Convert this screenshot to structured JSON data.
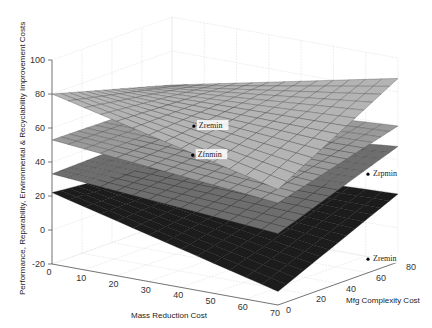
{
  "chart_data": {
    "type": "surface3d",
    "title": "",
    "xlabel": "Mass Reduction Cost",
    "ylabel": "Mfg Complexity Cost",
    "zlabel": "Performance, Reparability, Environmental & Recyclability Improvement Costs",
    "xlim": [
      0,
      70
    ],
    "ylim": [
      0,
      80
    ],
    "zlim": [
      -20,
      100
    ],
    "xticks": [
      0,
      10,
      20,
      30,
      40,
      50,
      60,
      70
    ],
    "yticks": [
      0,
      20,
      40,
      60,
      80
    ],
    "zticks": [
      -20,
      0,
      20,
      40,
      60,
      80,
      100
    ],
    "grid": true,
    "series": [
      {
        "name": "Performance surface",
        "shade": "#b4b4b4",
        "corners": {
          "x0y0": 80,
          "x70y0": 48,
          "x0y80": 60,
          "x70y80": 88
        },
        "min": 48
      },
      {
        "name": "Reparability surface",
        "shade": "#9a9a9a",
        "corners": {
          "x0y0": 53,
          "x70y0": 40,
          "x0y80": 52,
          "x70y80": 60
        },
        "min": 38
      },
      {
        "name": "Environmental surface",
        "shade": "#6e6e6e",
        "corners": {
          "x0y0": 33,
          "x70y0": 22,
          "x0y80": 35,
          "x70y80": 48
        },
        "min": 24
      },
      {
        "name": "Recyclability surface",
        "shade": "#1c1c1c",
        "corners": {
          "x0y0": 22,
          "x70y0": -12,
          "x0y80": 15,
          "x70y80": 20
        },
        "min": -12
      }
    ],
    "annotations": [
      {
        "text": "Zremin",
        "x": 30,
        "y": 30,
        "z": 62
      },
      {
        "text": "Zrpmin",
        "x": 70,
        "y": 60,
        "z": 38
      },
      {
        "text": "Zfnmin",
        "x": 25,
        "y": 40,
        "z": 40
      },
      {
        "text": "Zremin",
        "x": 70,
        "y": 60,
        "z": -12
      }
    ]
  }
}
